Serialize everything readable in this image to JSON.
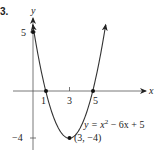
{
  "problem_number": "3.",
  "chart_data": {
    "type": "line",
    "title": "",
    "xlabel": "x",
    "ylabel": "y",
    "equation": "y = x² − 6x + 5",
    "x_ticks": [
      1,
      3,
      5
    ],
    "y_ticks": [
      5,
      -4
    ],
    "labeled_points": [
      {
        "x": 0,
        "y": 5,
        "label": "5"
      },
      {
        "x": 1,
        "y": 0,
        "label": "1"
      },
      {
        "x": 5,
        "y": 0,
        "label": "5"
      },
      {
        "x": 3,
        "y": -4,
        "label": "(3, −4)"
      }
    ],
    "vertex": {
      "x": 3,
      "y": -4,
      "label": "(3, −4)"
    },
    "x_range": [
      -0.1,
      6.1
    ],
    "grid": false,
    "series": [
      {
        "name": "y = x² − 6x + 5",
        "coefficients": {
          "a": 1,
          "b": -6,
          "c": 5
        }
      }
    ]
  },
  "labels": {
    "x_axis": "x",
    "y_axis": "y",
    "tick_x_1": "1",
    "tick_x_3": "3",
    "tick_x_5": "5",
    "tick_y_5": "5",
    "tick_y_neg4": "−4",
    "equation_lhs": "y = x",
    "equation_exp": "2",
    "equation_rhs": " − 6x + 5",
    "vertex_label": "(3, −4)"
  }
}
